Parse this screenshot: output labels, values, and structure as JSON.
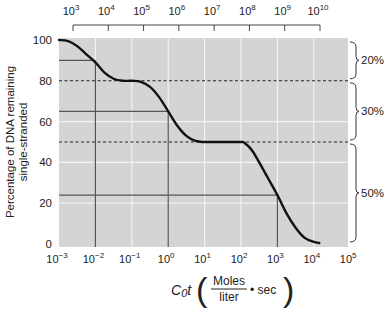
{
  "chart_data": {
    "type": "line",
    "title": "",
    "xlabel": "C0t (Moles/liter · sec)",
    "xlabel_parts": {
      "main": "C",
      "sub": "0",
      "t": "t",
      "num": "Moles",
      "den": "liter",
      "tail": "• sec"
    },
    "ylabel": "Percentage of DNA remaining single-stranded",
    "ylabel_lines": [
      "Percentage of DNA remaining",
      "single-stranded"
    ],
    "x_scale": "log10",
    "xlim_exp": [
      -3,
      5
    ],
    "ylim": [
      0,
      100
    ],
    "x_ticks": [
      {
        "exp": -3,
        "label": "10",
        "sup": "-3"
      },
      {
        "exp": -2,
        "label": "10",
        "sup": "-2"
      },
      {
        "exp": -1,
        "label": "10",
        "sup": "-1"
      },
      {
        "exp": 0,
        "label": "10",
        "sup": "0"
      },
      {
        "exp": 1,
        "label": "10",
        "sup": "1"
      },
      {
        "exp": 2,
        "label": "10",
        "sup": "2"
      },
      {
        "exp": 3,
        "label": "10",
        "sup": "3"
      },
      {
        "exp": 4,
        "label": "10",
        "sup": "4"
      },
      {
        "exp": 5,
        "label": "10",
        "sup": "5"
      }
    ],
    "y_ticks": [
      0,
      20,
      40,
      60,
      80,
      100
    ],
    "top_axis": {
      "ticks": [
        {
          "label": "10",
          "sup": "3"
        },
        {
          "label": "10",
          "sup": "4"
        },
        {
          "label": "10",
          "sup": "5"
        },
        {
          "label": "10",
          "sup": "6"
        },
        {
          "label": "10",
          "sup": "7"
        },
        {
          "label": "10",
          "sup": "8"
        },
        {
          "label": "10",
          "sup": "9"
        },
        {
          "label": "10",
          "sup": "10"
        }
      ]
    },
    "grid": true,
    "series": [
      {
        "name": "Reassociation curve",
        "points_log10x_y": [
          [
            -3.0,
            100
          ],
          [
            -2.75,
            99.5
          ],
          [
            -2.5,
            97
          ],
          [
            -2.25,
            93
          ],
          [
            -2.0,
            89
          ],
          [
            -1.75,
            84
          ],
          [
            -1.5,
            81
          ],
          [
            -1.25,
            80
          ],
          [
            -1.0,
            80
          ],
          [
            -0.75,
            79.5
          ],
          [
            -0.5,
            77
          ],
          [
            -0.25,
            72
          ],
          [
            0.0,
            65
          ],
          [
            0.25,
            58
          ],
          [
            0.5,
            53
          ],
          [
            0.75,
            50.5
          ],
          [
            1.0,
            50
          ],
          [
            1.5,
            50
          ],
          [
            2.0,
            50
          ],
          [
            2.1,
            49.5
          ],
          [
            2.3,
            46
          ],
          [
            2.5,
            40
          ],
          [
            2.75,
            32
          ],
          [
            3.0,
            24
          ],
          [
            3.25,
            15
          ],
          [
            3.5,
            8
          ],
          [
            3.75,
            3
          ],
          [
            4.0,
            1
          ],
          [
            4.15,
            0.5
          ]
        ]
      }
    ],
    "reference_lines": {
      "dashed_horizontal": [
        80,
        50
      ],
      "solid_horizontal": [
        {
          "y": 90,
          "to_exp": -2
        },
        {
          "y": 65,
          "to_exp": 0
        },
        {
          "y": 24,
          "to_exp": 3
        }
      ],
      "solid_vertical_exp": [
        -2,
        0,
        3
      ]
    },
    "annotations": [
      {
        "label": "20%",
        "from": 100,
        "to": 80
      },
      {
        "label": "30%",
        "from": 80,
        "to": 50
      },
      {
        "label": "50%",
        "from": 50,
        "to": 0
      }
    ]
  },
  "colors": {
    "plot_bg": "#d4d4d4",
    "grid": "#f2f2f2",
    "curve": "#111111",
    "reference": "#555555",
    "text": "#222222"
  }
}
